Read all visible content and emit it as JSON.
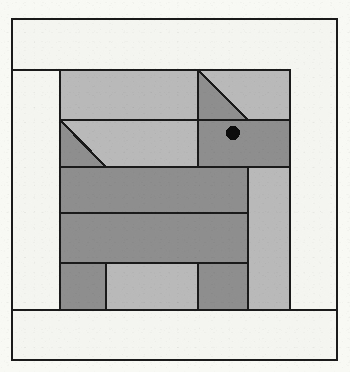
{
  "figure": {
    "kind": "quilt-block-pattern-diagram",
    "title": "Scottie Dog Quilt Block",
    "subject": "dog",
    "canvas": {
      "width": 350,
      "height": 372,
      "background": "#f8f8f5"
    },
    "line": {
      "color": "#1a1a1a",
      "weight": 2
    },
    "palette": {
      "background_fabric": "#f4f4f0",
      "light_fabric": "#b9b9b9",
      "dark_fabric": "#8e8e8e",
      "outline": "#1a1a1a",
      "eye": "#0d0d0d"
    },
    "outer_frame": {
      "x": 12,
      "y": 19,
      "width": 325,
      "height": 341,
      "label": "outer border frame"
    },
    "inner_block": {
      "x": 60,
      "y": 70,
      "width": 230,
      "height": 240,
      "label": "pieced center block"
    },
    "border_strips": [
      {
        "name": "top-border-strip",
        "fabric": "background",
        "x": 12,
        "y": 19,
        "width": 325,
        "height": 51
      },
      {
        "name": "left-border-strip",
        "fabric": "background",
        "x": 12,
        "y": 70,
        "width": 48,
        "height": 240
      },
      {
        "name": "right-border-strip",
        "fabric": "background",
        "x": 290,
        "y": 70,
        "width": 47,
        "height": 240
      },
      {
        "name": "bottom-border-strip",
        "fabric": "background",
        "x": 12,
        "y": 310,
        "width": 325,
        "height": 50
      }
    ],
    "rows": [
      {
        "name": "row-1-head-top",
        "y": 70,
        "height": 50,
        "patches": [
          {
            "name": "back-top-light",
            "shape": "rect",
            "fabric": "light",
            "x": 60,
            "y": 70,
            "width": 138,
            "height": 50
          },
          {
            "name": "ear-triangle-dark",
            "shape": "triangle",
            "fabric": "dark",
            "points": "198,70 248,120 198,120"
          },
          {
            "name": "ear-triangle-light",
            "shape": "triangle",
            "fabric": "light",
            "points": "198,70 248,70 248,120"
          },
          {
            "name": "head-top-right-light",
            "shape": "rect",
            "fabric": "light",
            "x": 248,
            "y": 70,
            "width": 42,
            "height": 50
          }
        ]
      },
      {
        "name": "row-2-head-face",
        "y": 120,
        "height": 47,
        "patches": [
          {
            "name": "tail-corner-triangle-dark",
            "shape": "triangle",
            "fabric": "dark",
            "points": "60,120 106,167 60,167"
          },
          {
            "name": "tail-corner-triangle-light",
            "shape": "triangle",
            "fabric": "light",
            "points": "60,120 198,120 198,167 106,167"
          },
          {
            "name": "face-dark",
            "shape": "rect",
            "fabric": "dark",
            "x": 198,
            "y": 120,
            "width": 92,
            "height": 47
          },
          {
            "name": "eye-dot",
            "shape": "circle",
            "fabric": "eye",
            "cx": 233,
            "cy": 133,
            "r": 7
          }
        ]
      },
      {
        "name": "row-3-body-upper",
        "y": 167,
        "height": 46,
        "patches": [
          {
            "name": "body-upper-dark",
            "shape": "rect",
            "fabric": "dark",
            "x": 60,
            "y": 167,
            "width": 188,
            "height": 46
          },
          {
            "name": "front-leg-column-light",
            "shape": "rect",
            "fabric": "light",
            "x": 248,
            "y": 167,
            "width": 42,
            "height": 46
          }
        ]
      },
      {
        "name": "row-4-body-lower",
        "y": 213,
        "height": 50,
        "patches": [
          {
            "name": "body-lower-dark",
            "shape": "rect",
            "fabric": "dark",
            "x": 60,
            "y": 213,
            "width": 188,
            "height": 50
          },
          {
            "name": "front-leg-column-light-2",
            "shape": "rect",
            "fabric": "light",
            "x": 248,
            "y": 213,
            "width": 42,
            "height": 50
          }
        ]
      },
      {
        "name": "row-5-legs",
        "y": 263,
        "height": 47,
        "patches": [
          {
            "name": "hind-leg-dark",
            "shape": "rect",
            "fabric": "dark",
            "x": 60,
            "y": 263,
            "width": 46,
            "height": 47
          },
          {
            "name": "leg-gap-light",
            "shape": "rect",
            "fabric": "light",
            "x": 106,
            "y": 263,
            "width": 92,
            "height": 47
          },
          {
            "name": "front-leg-dark",
            "shape": "rect",
            "fabric": "dark",
            "x": 198,
            "y": 263,
            "width": 50,
            "height": 47
          },
          {
            "name": "tail-column-light",
            "shape": "rect",
            "fabric": "light",
            "x": 248,
            "y": 263,
            "width": 42,
            "height": 47
          }
        ]
      }
    ]
  }
}
